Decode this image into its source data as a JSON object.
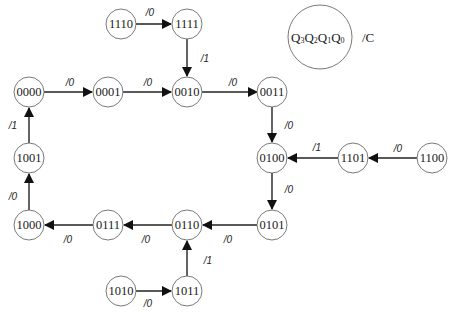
{
  "diagram": {
    "type": "state-transition",
    "legend": {
      "state_label": "Q3Q2Q1Q0",
      "state_parts": [
        {
          "base": "Q",
          "sub": "3"
        },
        {
          "base": "Q",
          "sub": "2"
        },
        {
          "base": "Q",
          "sub": "1"
        },
        {
          "base": "Q",
          "sub": "0"
        }
      ],
      "output_label": "/C"
    },
    "states": [
      {
        "id": "1110",
        "label": "1110"
      },
      {
        "id": "1111",
        "label": "1111"
      },
      {
        "id": "0000",
        "label": "0000"
      },
      {
        "id": "0001",
        "label": "0001"
      },
      {
        "id": "0010",
        "label": "0010"
      },
      {
        "id": "0011",
        "label": "0011"
      },
      {
        "id": "1001",
        "label": "1001"
      },
      {
        "id": "0100",
        "label": "0100"
      },
      {
        "id": "1101",
        "label": "1101"
      },
      {
        "id": "1100",
        "label": "1100"
      },
      {
        "id": "1000",
        "label": "1000"
      },
      {
        "id": "0111",
        "label": "0111"
      },
      {
        "id": "0110",
        "label": "0110"
      },
      {
        "id": "0101",
        "label": "0101"
      },
      {
        "id": "1010",
        "label": "1010"
      },
      {
        "id": "1011",
        "label": "1011"
      }
    ],
    "transitions": [
      {
        "from": "1110",
        "to": "1111",
        "label": "/0"
      },
      {
        "from": "1111",
        "to": "0010",
        "label": "/1"
      },
      {
        "from": "0000",
        "to": "0001",
        "label": "/0"
      },
      {
        "from": "0001",
        "to": "0010",
        "label": "/0"
      },
      {
        "from": "0010",
        "to": "0011",
        "label": "/0"
      },
      {
        "from": "0011",
        "to": "0100",
        "label": "/0"
      },
      {
        "from": "1100",
        "to": "1101",
        "label": "/0"
      },
      {
        "from": "1101",
        "to": "0100",
        "label": "/1"
      },
      {
        "from": "0100",
        "to": "0101",
        "label": "/0"
      },
      {
        "from": "0101",
        "to": "0110",
        "label": "/0"
      },
      {
        "from": "1010",
        "to": "1011",
        "label": "/0"
      },
      {
        "from": "1011",
        "to": "0110",
        "label": "/1"
      },
      {
        "from": "0110",
        "to": "0111",
        "label": "/0"
      },
      {
        "from": "0111",
        "to": "1000",
        "label": "/0"
      },
      {
        "from": "1000",
        "to": "1001",
        "label": "/0"
      },
      {
        "from": "1001",
        "to": "0000",
        "label": "/1"
      }
    ]
  }
}
